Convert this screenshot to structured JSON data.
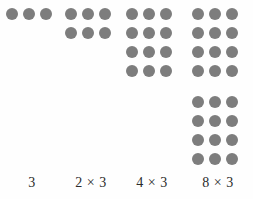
{
  "figure": {
    "background_color": "#fefefe",
    "dot_color": "#7d7d7d",
    "label_color": "#2b2b2b",
    "columns_per_row": 3
  },
  "groups": [
    {
      "id": "group-1",
      "label": "3",
      "factor_a": "",
      "times_symbol": "",
      "factor_b": "",
      "rows": 1,
      "columns": 3,
      "total_dots": 3,
      "gap_after_row": null
    },
    {
      "id": "group-2",
      "label": "2 × 3",
      "factor_a": "2",
      "times_symbol": "×",
      "factor_b": "3",
      "rows": 2,
      "columns": 3,
      "total_dots": 6,
      "gap_after_row": null
    },
    {
      "id": "group-3",
      "label": "4 × 3",
      "factor_a": "4",
      "times_symbol": "×",
      "factor_b": "3",
      "rows": 4,
      "columns": 3,
      "total_dots": 12,
      "gap_after_row": null
    },
    {
      "id": "group-4",
      "label": "8 × 3",
      "factor_a": "8",
      "times_symbol": "×",
      "factor_b": "3",
      "rows": 8,
      "columns": 3,
      "total_dots": 24,
      "gap_after_row": 4
    }
  ]
}
